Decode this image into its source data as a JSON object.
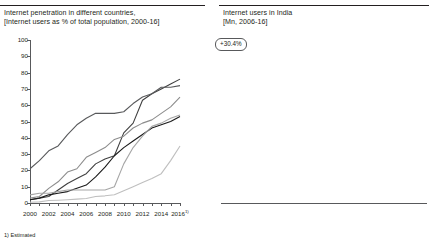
{
  "left_panel": {
    "title": "Internet penetration in different countries,\n[Internet users as % of total population, 2000-16]",
    "footnote": "1) Estimated",
    "legend": [
      "Russia",
      "Malaysia",
      "Brazil",
      "China",
      "South\nAfrica",
      "India"
    ]
  },
  "right_panel": {
    "title": "Internet users in India\n[Mn, 2006-16]",
    "callout": "+30.4%"
  },
  "chart_data": [
    {
      "type": "line",
      "title": "Internet penetration in different countries",
      "subtitle": "[Internet users as % of total population, 2000-16]",
      "xlabel": "",
      "ylabel": "",
      "ylim": [
        0,
        100
      ],
      "ytick_labels": [
        "0",
        "10",
        "20",
        "30",
        "40",
        "50",
        "60",
        "70",
        "80",
        "90",
        "100"
      ],
      "xtick_labels": [
        "2000",
        "2002",
        "2004",
        "2006",
        "2008",
        "2010",
        "2012",
        "2014",
        "2016"
      ],
      "xtick_sup": [
        "",
        "",
        "",
        "",
        "",
        "",
        "",
        "",
        "1)"
      ],
      "x": [
        2000,
        2001,
        2002,
        2003,
        2004,
        2005,
        2006,
        2007,
        2008,
        2009,
        2010,
        2011,
        2012,
        2013,
        2014,
        2015,
        2016
      ],
      "grid": false,
      "legend_position": "right",
      "series": [
        {
          "name": "Russia",
          "color": "#404040",
          "values": [
            2,
            3,
            4,
            8,
            12,
            15,
            18,
            24,
            27,
            29,
            43,
            49,
            63,
            67,
            70,
            73,
            76
          ]
        },
        {
          "name": "Malaysia",
          "color": "#58595b",
          "values": [
            21,
            26,
            32,
            35,
            42,
            48,
            52,
            55,
            55,
            55,
            56,
            61,
            65,
            67,
            71,
            71,
            72
          ]
        },
        {
          "name": "Brazil",
          "color": "#8c8c8c",
          "values": [
            3,
            4,
            9,
            13,
            19,
            21,
            28,
            31,
            34,
            39,
            41,
            46,
            49,
            51,
            55,
            59,
            65
          ]
        },
        {
          "name": "China",
          "color": "#1a1a1a",
          "values": [
            2,
            3,
            5,
            6,
            7,
            9,
            11,
            16,
            22,
            29,
            34,
            38,
            42,
            46,
            48,
            50,
            53
          ]
        },
        {
          "name": "South Africa",
          "color": "#a6a6a6",
          "values": [
            5,
            6,
            6,
            7,
            8,
            8,
            8,
            8,
            8,
            10,
            24,
            34,
            41,
            47,
            49,
            52,
            54
          ]
        },
        {
          "name": "India",
          "color": "#bfbfbf",
          "values": [
            0.5,
            0.7,
            1.5,
            1.7,
            2,
            2.4,
            2.8,
            4,
            4.4,
            5.1,
            7.5,
            10,
            12.6,
            15,
            18,
            26,
            35
          ]
        }
      ]
    },
    {
      "type": "bar",
      "title": "Internet users in India",
      "subtitle": "[Mn, 2006-16]",
      "xlabel": "",
      "ylabel": "",
      "categories": [
        "2006",
        "2007",
        "2008",
        "2009",
        "2010",
        "2011",
        "2012",
        "2013",
        "2014",
        "2015",
        "2016"
      ],
      "category_sup": [
        "",
        "",
        "",
        "",
        "",
        "",
        "",
        "",
        "",
        "1)",
        "1)"
      ],
      "values": [
        33,
        47,
        52,
        62,
        92,
        126,
        159,
        193,
        233,
        354,
        462
      ],
      "ylim": [
        0,
        500
      ],
      "grid": false,
      "bar_color": "#b3b3b3",
      "annotations": [
        {
          "text": "+30.4%",
          "type": "cagr-arrow"
        }
      ]
    }
  ]
}
